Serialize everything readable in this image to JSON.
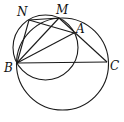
{
  "diagram": {
    "type": "geometry",
    "points": {
      "A": {
        "label": "A",
        "x": 74,
        "y": 33
      },
      "B": {
        "label": "B",
        "x": 17,
        "y": 63
      },
      "C": {
        "label": "C",
        "x": 107,
        "y": 62
      },
      "M": {
        "label": "M",
        "x": 59,
        "y": 18
      },
      "N": {
        "label": "N",
        "x": 29,
        "y": 20
      }
    },
    "circles": [
      {
        "name": "large",
        "cx": 62.5,
        "cy": 64,
        "r": 46
      },
      {
        "name": "small",
        "cx": 45.5,
        "cy": 47.5,
        "r": 32.5
      }
    ],
    "segments": [
      [
        "B",
        "C"
      ],
      [
        "B",
        "A"
      ],
      [
        "B",
        "M"
      ],
      [
        "B",
        "N"
      ],
      [
        "N",
        "M"
      ],
      [
        "N",
        "A"
      ],
      [
        "M",
        "C"
      ]
    ],
    "stroke_color": "#1a1a1a"
  }
}
